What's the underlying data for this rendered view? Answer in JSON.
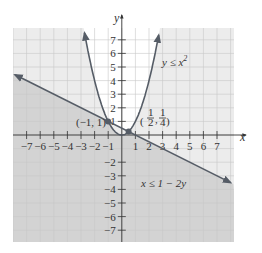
{
  "chart_data": {
    "type": "line",
    "title": "",
    "xlabel": "x",
    "ylabel": "y",
    "xlim": [
      -8,
      8
    ],
    "ylim": [
      -8,
      8
    ],
    "grid": true,
    "x_ticks": [
      -7,
      -6,
      -5,
      -4,
      -3,
      -2,
      -1,
      1,
      2,
      3,
      4,
      5,
      6,
      7
    ],
    "y_ticks": [
      -7,
      -6,
      -5,
      -4,
      -3,
      -2,
      1,
      2,
      3,
      4,
      5,
      6,
      7
    ],
    "x_tick_labels": [
      "−7",
      "−6",
      "−5",
      "−4",
      "−3",
      "−2",
      "−1",
      "1",
      "2",
      "3",
      "4",
      "5",
      "6",
      "7"
    ],
    "y_tick_labels": [
      "−7",
      "−6",
      "−5",
      "−4",
      "−3",
      "−2",
      "1",
      "2",
      "3",
      "4",
      "5",
      "6",
      "7"
    ],
    "series": [
      {
        "name": "y ≤ x²",
        "kind": "parabola",
        "equation": "y = x^2",
        "x_range": [
          -2.74,
          2.74
        ],
        "shaded": "below curve"
      },
      {
        "name": "x ≤ 1 − 2y",
        "kind": "line",
        "equation": "y = (1 - x) / 2",
        "x_range": [
          -8,
          8
        ],
        "shaded": "below line"
      }
    ],
    "points": [
      {
        "x": -1,
        "y": 1,
        "label": "(−1, 1)"
      },
      {
        "x": 0.5,
        "y": 0.25,
        "label": "(1/2, 1/4)"
      }
    ],
    "annotations": {
      "parabola_label": "y ≤ x",
      "parabola_label_sup": "2",
      "line_label": "x ≤ 1 − 2y",
      "point_a_label": "(−1, 1)",
      "point_b_num1": "1",
      "point_b_den1": "2",
      "point_b_num2": "1",
      "point_b_den2": "4"
    },
    "colors": {
      "background": "#ffffff",
      "light_region": "#ececec",
      "dark_region": "#d3d3d3",
      "grid": "#c8c8c8",
      "curve": "#555c66",
      "axis": "#333333"
    }
  }
}
